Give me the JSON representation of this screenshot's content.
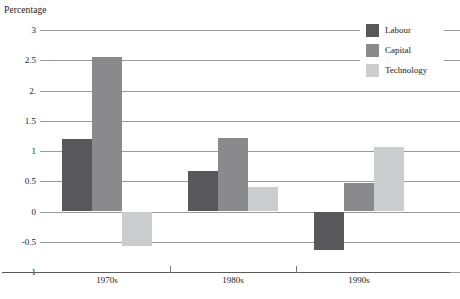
{
  "chart_data": {
    "type": "bar",
    "title": "",
    "xlabel": "",
    "ylabel": "Percentage",
    "categories": [
      "1970s",
      "1980s",
      "1990s"
    ],
    "series": [
      {
        "name": "Labour",
        "color": "#58585a",
        "values": [
          1.2,
          0.67,
          -0.64
        ]
      },
      {
        "name": "Capital",
        "color": "#8a8a8c",
        "values": [
          2.55,
          1.22,
          0.47
        ]
      },
      {
        "name": "Technology",
        "color": "#cccdce",
        "values": [
          -0.57,
          0.4,
          1.07
        ]
      }
    ],
    "ylim": [
      -1,
      3
    ],
    "ytick_values": [
      3,
      2.5,
      2,
      1.5,
      1,
      0.5,
      0,
      -0.5,
      -1
    ],
    "ytick_labels": [
      "3",
      "2.5",
      "2.",
      "1.5",
      "1",
      "0.5",
      "0",
      "-0.5",
      "-1"
    ],
    "grid": true,
    "grid_axis": "y",
    "legend_position": "top-right",
    "legend_entries": [
      "Labour",
      "Capital",
      "Technology"
    ]
  },
  "axis": {
    "y_title": "Percentage"
  },
  "colors": {
    "labour": "#58585a",
    "capital": "#8a8a8c",
    "technology": "#cccdce",
    "gridline": "#9a9a9a",
    "axis": "#5a5a5a",
    "background": "#ffffff"
  }
}
